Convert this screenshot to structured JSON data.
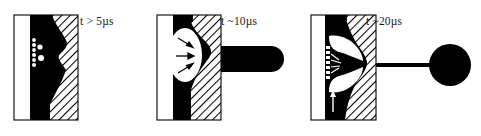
{
  "figure": {
    "background_color": "#ffffff",
    "ink_color": "#000000",
    "hatch_color": "#000000",
    "panel_count": 3
  },
  "panels": [
    {
      "id": "panel-1",
      "time_label": "t > 5µs",
      "stage_name": "bubble-nucleation",
      "description": "Row of small white cavitation nuclei along the dark absorbing layer with a concave black cavity bulging into the hatched tissue",
      "regions": {
        "left_region": "white",
        "middle_band": "black",
        "right_region": "hatched"
      },
      "nuclei_count": 8,
      "arrow_count": 0
    },
    {
      "id": "panel-2",
      "time_label": "t ~10µs",
      "stage_name": "bubble-expansion-and-jet",
      "description": "Large white elliptical bubble with three converging arrows and a blunt black jet penetrating right through the hatched region",
      "regions": {
        "left_region": "white",
        "middle_band": "black",
        "right_region": "hatched"
      },
      "nuclei_count": 7,
      "arrow_count": 3,
      "arrow_direction": "inward-right"
    },
    {
      "id": "panel-3",
      "time_label": "t ~20µs",
      "stage_name": "jet-pinch-off-droplet",
      "description": "Collapsed hourglass neck with white lobes, a long thin black jet and a large round droplet detached at the far right; a vertical arrow points upward below the neck",
      "regions": {
        "left_region": "white",
        "middle_band": "black",
        "right_region": "hatched"
      },
      "nuclei_count": 7,
      "arrow_count": 1,
      "arrow_direction": "upward",
      "droplet": {
        "shape": "circle",
        "color": "#000000"
      }
    }
  ],
  "labels": {
    "panel_1_time": "t > 5µs",
    "panel_2_time": "t ~10µs",
    "panel_3_time": "t ~20µs"
  }
}
